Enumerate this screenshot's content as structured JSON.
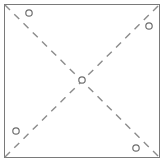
{
  "figure": {
    "title": "",
    "background_color": "#ffffff",
    "width": 166,
    "height": 163
  },
  "frame": {
    "name": "square-boundary",
    "x": 4.5,
    "y": 4.5,
    "width": 155,
    "height": 153,
    "stroke_color": "#7a7a7a",
    "stroke_width": 1,
    "fill": "none"
  },
  "diagonals": {
    "stroke_color": "#8c8c8c",
    "stroke_width": 1.4,
    "dash_length": 7,
    "dash_gap": 6,
    "lines": [
      {
        "name": "diagonal-top-left-to-bottom-right",
        "x1": 5,
        "y1": 5,
        "x2": 159,
        "y2": 157
      },
      {
        "name": "diagonal-bottom-left-to-top-right",
        "x1": 5,
        "y1": 157,
        "x2": 159,
        "y2": 5
      }
    ]
  },
  "markers": {
    "stroke_color": "#6e6e6e",
    "stroke_width": 1.2,
    "fill_color": "#ffffff",
    "radius": 3.2,
    "points": [
      {
        "name": "marker-top-left",
        "label": "",
        "cx": 29,
        "cy": 13
      },
      {
        "name": "marker-top-right",
        "label": "",
        "cx": 149,
        "cy": 26
      },
      {
        "name": "marker-center",
        "label": "",
        "cx": 82,
        "cy": 80
      },
      {
        "name": "marker-bottom-left",
        "label": "",
        "cx": 16,
        "cy": 131
      },
      {
        "name": "marker-bottom-right",
        "label": "",
        "cx": 136,
        "cy": 148
      }
    ]
  },
  "chart_data": {
    "type": "scatter",
    "title": "",
    "xlabel": "",
    "ylabel": "",
    "xlim": [
      4.5,
      159.5
    ],
    "ylim": [
      4.5,
      157.5
    ],
    "grid": false,
    "legend": "none",
    "annotations": [
      "dashed diagonal from top-left corner to bottom-right corner",
      "dashed diagonal from bottom-left corner to top-right corner",
      "square outline border"
    ],
    "series": [
      {
        "name": "markers",
        "marker": "open-circle",
        "x": [
          29,
          149,
          82,
          16,
          136
        ],
        "y": [
          13,
          26,
          80,
          131,
          148
        ]
      }
    ]
  }
}
